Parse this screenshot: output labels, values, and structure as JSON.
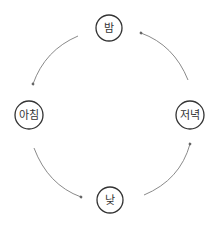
{
  "diagram": {
    "type": "cycle",
    "nodes": [
      {
        "id": "night",
        "label": "밤",
        "cx": 109,
        "cy": 28,
        "r": 13
      },
      {
        "id": "morning",
        "label": "아침",
        "cx": 29,
        "cy": 115,
        "r": 14
      },
      {
        "id": "day",
        "label": "낮",
        "cx": 110,
        "cy": 200,
        "r": 13
      },
      {
        "id": "evening",
        "label": "저녁",
        "cx": 190,
        "cy": 115,
        "r": 14
      }
    ],
    "edges": [
      {
        "from": "밤",
        "to": "아침"
      },
      {
        "from": "아침",
        "to": "낮"
      },
      {
        "from": "낮",
        "to": "저녁"
      },
      {
        "from": "저녁",
        "to": "밤"
      }
    ],
    "colors": {
      "node_stroke": "#333333",
      "edge_stroke": "#8a8a8a",
      "text": "#333333",
      "background": "#ffffff"
    }
  }
}
